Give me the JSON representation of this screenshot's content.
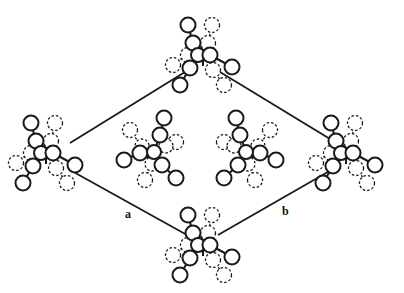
{
  "figure": {
    "type": "crystal-packing-diagram",
    "axis_labels": {
      "a": "a",
      "b": "b"
    },
    "cell_vertices": {
      "left": [
        41,
        156
      ],
      "top": [
        200,
        58
      ],
      "right": [
        355,
        156
      ],
      "bottom": [
        200,
        250
      ]
    },
    "cell_edges": [
      {
        "name": "edge-top-left",
        "from": [
          70,
          143
        ],
        "to": [
          185,
          72
        ]
      },
      {
        "name": "edge-top-right",
        "from": [
          220,
          72
        ],
        "to": [
          335,
          142
        ]
      },
      {
        "name": "edge-bottom-left",
        "from": [
          70,
          170
        ],
        "to": [
          187,
          235
        ]
      },
      {
        "name": "edge-bottom-right",
        "from": [
          218,
          235
        ],
        "to": [
          333,
          169
        ]
      }
    ],
    "label_positions": {
      "a": [
        125,
        218
      ],
      "b": [
        282,
        215
      ]
    },
    "molecules": [
      {
        "name": "molecule-top",
        "center": [
          200,
          58
        ],
        "variant": "corner"
      },
      {
        "name": "molecule-left",
        "center": [
          43,
          156
        ],
        "variant": "corner"
      },
      {
        "name": "molecule-right",
        "center": [
          343,
          156
        ],
        "variant": "corner"
      },
      {
        "name": "molecule-bottom",
        "center": [
          200,
          248
        ],
        "variant": "corner"
      },
      {
        "name": "molecule-center-left",
        "center": [
          150,
          152
        ],
        "variant": "center-left"
      },
      {
        "name": "molecule-center-right",
        "center": [
          250,
          152
        ],
        "variant": "center-right"
      }
    ],
    "colors": {
      "line": "#1a1a1a",
      "atom_fill": "#ffffff",
      "background": "#ffffff"
    }
  }
}
